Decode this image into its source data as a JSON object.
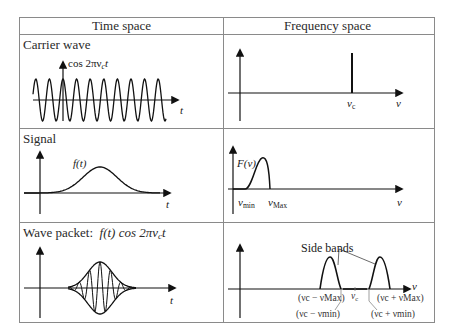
{
  "table": {
    "headers": [
      "Time space",
      "Frequency space"
    ],
    "rows": [
      {
        "label": "Carrier wave",
        "time": {
          "curve_label": "cos 2πν",
          "curve_sub": "c",
          "curve_tail": "t",
          "axis_label": "t"
        },
        "freq": {
          "peak_label": "ν",
          "peak_sub": "c",
          "axis_label": "ν"
        }
      },
      {
        "label": "Signal",
        "time": {
          "curve_label": "f(t)",
          "axis_label": "t"
        },
        "freq": {
          "curve_label": "F(ν)",
          "min_label": "ν",
          "min_sub": "min",
          "max_label": "ν",
          "max_sub": "Max",
          "axis_label": "ν"
        }
      },
      {
        "label": "Wave packet:",
        "label_formula": "f(t) cos 2πν",
        "label_formula_sub": "c",
        "label_formula_tail": "t",
        "time": {
          "axis_label": "t"
        },
        "freq": {
          "annotation": "Side bands",
          "axis_label": "ν",
          "center_label": "ν",
          "center_sub": "c",
          "tick_labels": {
            "lower_max": "(νc − νMax)",
            "lower_min": "(νc − νmin)",
            "upper_max": "(νc + νMax)",
            "upper_min": "(νc + νmin)"
          }
        }
      }
    ]
  },
  "colors": {
    "grid": "#8a8a8a",
    "ink": "#111111"
  }
}
